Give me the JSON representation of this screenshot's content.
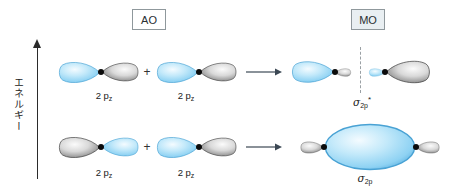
{
  "axis": {
    "label": "エネルギー"
  },
  "headers": {
    "ao": "AO",
    "mo": "MO"
  },
  "plus": "+",
  "rows": {
    "antibonding": {
      "orbital1": {
        "base": "2 p",
        "sub": "z"
      },
      "orbital2": {
        "base": "2 p",
        "sub": "z"
      },
      "mo": {
        "symbol": "σ",
        "sub": "2p",
        "sup": "*"
      }
    },
    "bonding": {
      "orbital1": {
        "base": "2 p",
        "sub": "z"
      },
      "orbital2": {
        "base": "2 p",
        "sub": "z"
      },
      "mo": {
        "symbol": "σ",
        "sub": "2p",
        "sup": ""
      }
    }
  },
  "icons": {
    "energy_axis": "up-arrow",
    "combine": "right-arrow",
    "node": "vertical-dashed-line"
  },
  "colors": {
    "lobe_blue": "#4fa8dc",
    "lobe_blue_light": "#f4fbff",
    "lobe_gray_dark": "#555555",
    "lobe_gray_light": "#fbfbfb",
    "mo_box_bg": "#e9eff2",
    "box_border": "#8f989c",
    "text": "#222222"
  }
}
